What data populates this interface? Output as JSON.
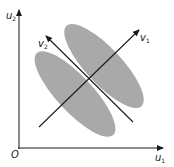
{
  "diagram": {
    "axes": {
      "origin_label": "O",
      "x_label": "u",
      "x_sub": "1",
      "y_label": "u",
      "y_sub": "2"
    },
    "vectors": [
      {
        "label": "v",
        "sub": "1"
      },
      {
        "label": "v",
        "sub": "2"
      }
    ],
    "clusters": [
      {
        "name": "upper-right-cluster"
      },
      {
        "name": "lower-left-cluster"
      }
    ],
    "colors": {
      "cluster_fill": "#a9a9a9",
      "line": "#1a1a1a",
      "background": "#ffffff"
    }
  }
}
